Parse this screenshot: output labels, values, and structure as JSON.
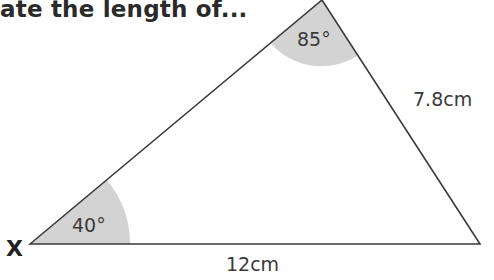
{
  "question": {
    "title_fragment": "ate the length of..."
  },
  "triangle": {
    "vertices": {
      "left": {
        "label": "X"
      },
      "top": {
        "label": ""
      },
      "right": {
        "label": ""
      }
    },
    "angles": {
      "left": "40°",
      "top": "85°"
    },
    "sides": {
      "bottom": "12cm",
      "right": "7.8cm"
    },
    "colors": {
      "line": "#3a3a3a",
      "angle_fill": "#d3d3d3",
      "background": "#ffffff"
    }
  }
}
